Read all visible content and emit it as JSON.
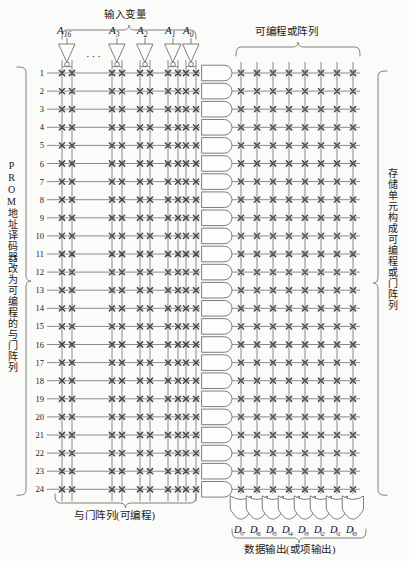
{
  "figure": {
    "title_top": "输入变量",
    "title_or_array": "可编程或阵列",
    "title_and_array": "与门阵列(可编程)",
    "title_outputs": "数据输出(或项输出)",
    "label_left": "PROM地址译码器改为可编程的与门阵列",
    "label_right": "存储单元构成可编程或门阵列",
    "ellipsis": "···"
  },
  "inputs": [
    {
      "name": "A",
      "sub": "16"
    },
    {
      "name": "A",
      "sub": "3"
    },
    {
      "name": "A",
      "sub": "2"
    },
    {
      "name": "A",
      "sub": "1"
    },
    {
      "name": "A",
      "sub": "0"
    }
  ],
  "outputs": [
    {
      "name": "D",
      "sub": "7"
    },
    {
      "name": "D",
      "sub": "6"
    },
    {
      "name": "D",
      "sub": "5"
    },
    {
      "name": "D",
      "sub": "4"
    },
    {
      "name": "D",
      "sub": "3"
    },
    {
      "name": "D",
      "sub": "2"
    },
    {
      "name": "D",
      "sub": "1"
    },
    {
      "name": "D",
      "sub": "0"
    }
  ],
  "rows": [
    "1",
    "2",
    "3",
    "4",
    "5",
    "6",
    "7",
    "8",
    "9",
    "10",
    "11",
    "12",
    "13",
    "14",
    "15",
    "16",
    "17",
    "18",
    "19",
    "20",
    "21",
    "22",
    "23",
    "24"
  ],
  "colors": {
    "background": "#fbfbf9",
    "line": "#6f6f6f",
    "ink": "#1a1a1a",
    "cross": "#4a4a4a"
  },
  "geometry": {
    "row_count": 24,
    "input_count": 5,
    "output_count": 8,
    "or_column_count": 8
  }
}
